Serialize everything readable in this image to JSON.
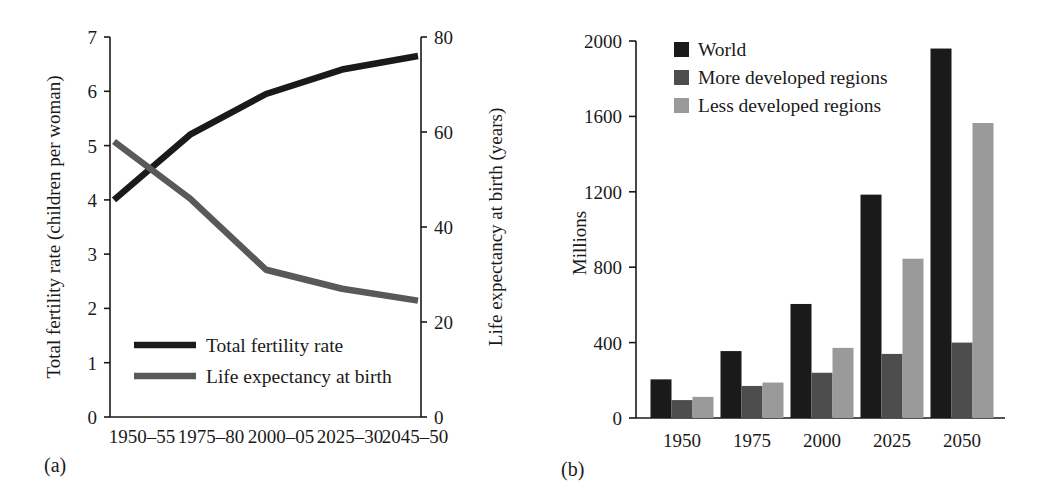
{
  "figure": {
    "panel_a_label": "(a)",
    "panel_b_label": "(b)"
  },
  "colors": {
    "black": "#1a1a1a",
    "dark_gray": "#4d4d4d",
    "mid_gray": "#595959",
    "light_gray": "#9a9a9a",
    "axis": "#1a1a1a",
    "background": "#ffffff"
  },
  "chart_data": [
    {
      "id": "panel-a",
      "type": "line",
      "title": "",
      "xlabel": "",
      "ylabel": "Total fertility rate (children per woman)",
      "y2label": "Life expectancy at birth (years)",
      "categories": [
        "1950–55",
        "1975–80",
        "2000–05",
        "2025–30",
        "2045–50"
      ],
      "ylim": [
        0,
        7
      ],
      "yticks": [
        0,
        1,
        2,
        3,
        4,
        5,
        6,
        7
      ],
      "ytick_labels": [
        "0",
        "1",
        "2",
        "3",
        "4",
        "5",
        "6",
        "7"
      ],
      "y2lim": [
        0,
        80
      ],
      "y2ticks": [
        0,
        20,
        40,
        60,
        80
      ],
      "y2tick_labels": [
        "0",
        "20",
        "40",
        "60",
        "80"
      ],
      "grid": false,
      "legend_position": "lower-left-inside",
      "series": [
        {
          "name": "Total fertility rate",
          "axis": "left",
          "color": "#1a1a1a",
          "values": [
            4.0,
            5.2,
            5.95,
            6.4,
            6.65
          ]
        },
        {
          "name": "Life expectancy at birth",
          "axis": "right",
          "color": "#595959",
          "values": [
            58,
            46,
            31,
            27,
            24.5
          ]
        }
      ]
    },
    {
      "id": "panel-b",
      "type": "bar",
      "title": "",
      "xlabel": "",
      "ylabel": "Millions",
      "categories": [
        "1950",
        "1975",
        "2000",
        "2025",
        "2050"
      ],
      "ylim": [
        0,
        2000
      ],
      "yticks": [
        0,
        400,
        800,
        1200,
        1600,
        2000
      ],
      "ytick_labels": [
        "0",
        "400",
        "800",
        "1200",
        "1600",
        "2000"
      ],
      "grid": false,
      "legend_position": "top-left-inside",
      "series": [
        {
          "name": "World",
          "color": "#1a1a1a",
          "values": [
            205,
            355,
            605,
            1185,
            1960
          ]
        },
        {
          "name": "More developed regions",
          "color": "#4d4d4d",
          "values": [
            95,
            170,
            240,
            340,
            400
          ]
        },
        {
          "name": "Less developed regions",
          "color": "#9a9a9a",
          "values": [
            112,
            188,
            372,
            845,
            1565
          ]
        }
      ]
    }
  ]
}
